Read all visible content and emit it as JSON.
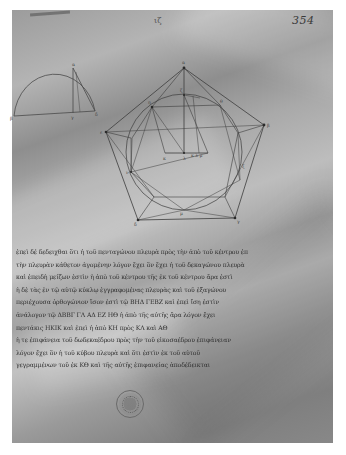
{
  "document": {
    "type": "manuscript folio",
    "page_number": "354",
    "head_mark": "ιζ",
    "colors": {
      "background": "#ffffff",
      "parchment": "#a6a6a6",
      "ink": "#2e2e2e"
    }
  },
  "diagrams": {
    "semicircle": {
      "description": "semicircle with perpendicular and chord",
      "labels": [
        "α",
        "β",
        "γ",
        "δ"
      ]
    },
    "pentagon": {
      "description": "regular pentagon circumscribing a circle with inscribed pentagon and construction lines",
      "labels": [
        "α",
        "β",
        "γ",
        "δ",
        "ε",
        "ζ",
        "η",
        "θ",
        "κ",
        "λ",
        "μ",
        "ν"
      ],
      "center_labels": "κ λ μ"
    }
  },
  "text": {
    "lines": [
      "ἐπεὶ δέ δεδειχθαι ὅτι ἡ τοῦ πενταγώνου πλευρὰ πρὸς τὴν ἀπὸ τοῦ κέντρου ἐπὶ",
      "τὴν πλευρὰν κάθετον ἀγομένην λόγον ἔχει ὃν ἔχει ἡ τοῦ δεκαγώνου πλευρὰ",
      "καὶ ἐπειδὴ μείζων ἐστὶν ἡ ἀπὸ τοῦ κέντρου τῆς ἐκ τοῦ κέντρου ἄρα ἐστὶ",
      "ἡ δὲ τὰς ἐν τῷ αὐτῷ κύκλῳ ἐγγραφομένας πλευρὰς καὶ τοῦ ἑξαγώνου",
      "περιέχουσα ὀρθογώνιον ἴσον ἐστὶ τῷ ΒΗΔ ΓΕΒΖ καὶ ἐπεὶ ἴση ἐστὶν",
      "ἀνάλογον τῷ ΔΒΒΓ ΓΛ ΑΔ ΕΖ ΗΘ ἡ ἀπὸ τῆς αὐτῆς ἄρα λόγον ἔχει",
      "πεντάκις ΗΚΙΚ καὶ ἐπεὶ ἡ ἀπὸ ΚΗ πρὸς ΚΛ καὶ ΑΘ",
      "ἡ τε ἐπιφάνεια τοῦ δωδεκαέδρου πρὸς τὴν τοῦ εἰκοσαέδρου ἐπιφάνειαν",
      "λόγον ἔχει ὃν ἡ τοῦ κύβου πλευρὰ καὶ ὅτι ἐστὶν ἐκ τοῦ αὐτοῦ",
      "γεγραμμένων τοῦ ἐκ ΚΘ καὶ τῆς αὐτῆς ἐπιφανείας ἀποδέδεικται"
    ]
  },
  "stamp": {
    "description": "circular library stamp"
  }
}
